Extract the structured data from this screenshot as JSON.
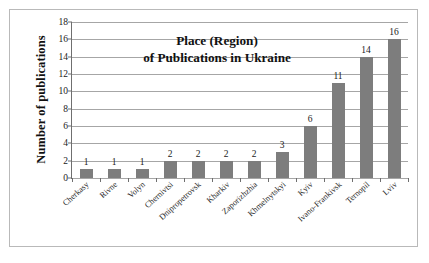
{
  "chart_data": {
    "type": "bar",
    "title": "Place (Region) of Publications in Ukraine",
    "title_line1": "Place (Region)",
    "title_line2": "of Publications in Ukraine",
    "xlabel": "",
    "ylabel": "Number of publications",
    "ylim": [
      0,
      18
    ],
    "ytick_step": 2,
    "yticks": [
      18,
      16,
      14,
      12,
      10,
      8,
      6,
      4,
      2,
      0
    ],
    "grid": true,
    "legend": null,
    "bar_color": "#7d7d7d",
    "categories": [
      "Cherkasy",
      "Rivne",
      "Volyn",
      "Chernivtsi",
      "Dnipropetrovsk",
      "Kharkiv",
      "Zaporizhzhia",
      "Khmelnytskyi",
      "Kyiv",
      "Ivano-Frankivsk",
      "Ternopil",
      "Lviv"
    ],
    "values": [
      1,
      1,
      1,
      2,
      2,
      2,
      2,
      3,
      6,
      11,
      14,
      16
    ],
    "data_labels": [
      "1",
      "1",
      "1",
      "2",
      "2",
      "2",
      "2",
      "3",
      "6",
      "11",
      "14",
      "16"
    ]
  }
}
